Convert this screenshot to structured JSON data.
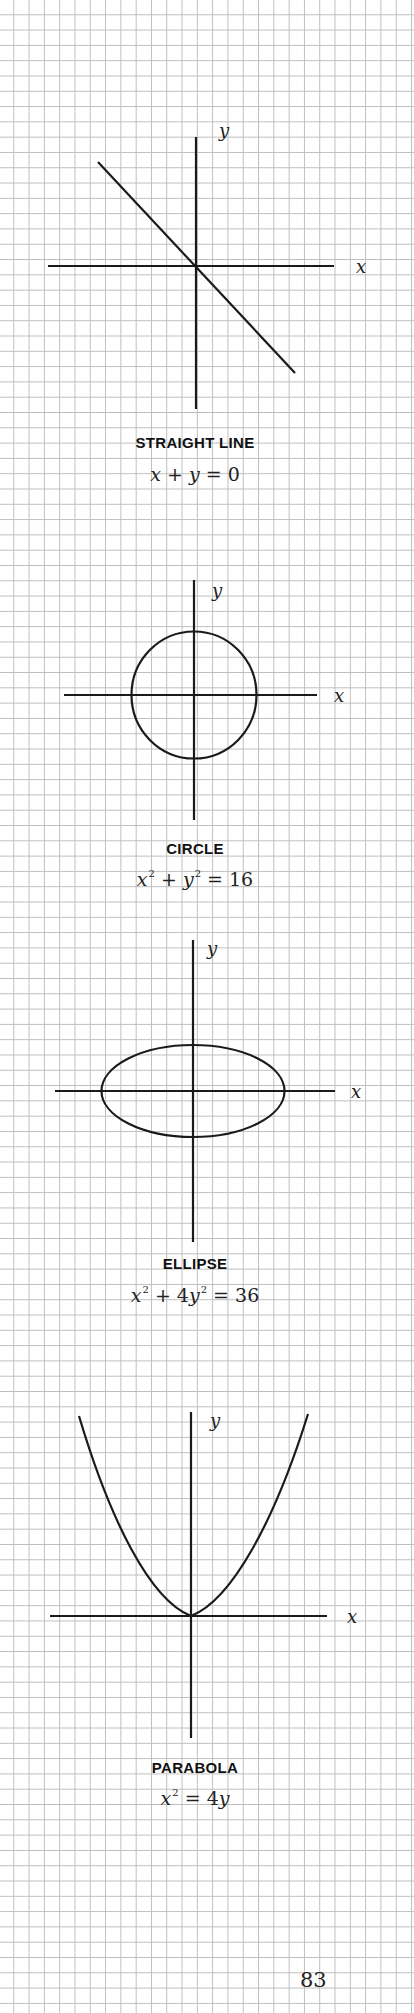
{
  "page": {
    "page_number": "83",
    "grid_color": "#bdbdbd",
    "ink_color": "#1a1a1a"
  },
  "graphs": [
    {
      "id": "straight-line",
      "title": "STRAIGHT LINE",
      "equation": {
        "lhs": [
          "x",
          "+",
          "y"
        ],
        "rhs": "0",
        "text": "x + y = 0"
      },
      "axis_labels": {
        "x": "x",
        "y": "y"
      }
    },
    {
      "id": "circle",
      "title": "CIRCLE",
      "equation": {
        "text": "x² + y² = 16",
        "rhs": "16"
      },
      "axis_labels": {
        "x": "x",
        "y": "y"
      }
    },
    {
      "id": "ellipse",
      "title": "ELLIPSE",
      "equation": {
        "text": "x² + 4y² = 36",
        "coef": "4",
        "rhs": "36"
      },
      "axis_labels": {
        "x": "x",
        "y": "y"
      }
    },
    {
      "id": "parabola",
      "title": "PARABOLA",
      "equation": {
        "text": "x² = 4y",
        "coef": "4"
      },
      "axis_labels": {
        "x": "x",
        "y": "y"
      }
    }
  ],
  "symbols": {
    "x": "x",
    "y": "y",
    "plus": "+",
    "equals": "=",
    "squared": "2"
  }
}
